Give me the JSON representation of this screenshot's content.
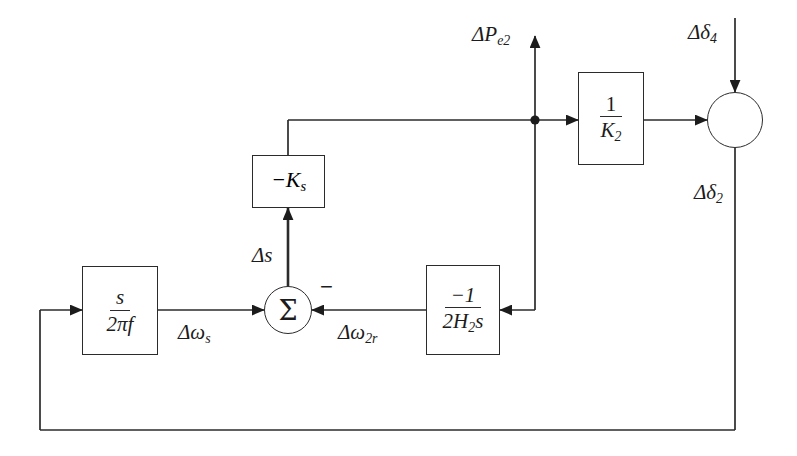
{
  "diagram": {
    "background_color": "#ffffff",
    "line_color": "#2b2b2b",
    "blocks": [
      {
        "id": "gain_s_2pif",
        "name": "s-over-2pif-block",
        "numerator": "s",
        "denominator": "2πf"
      },
      {
        "id": "gain_neg_ks",
        "name": "negative-ks-block",
        "label": "−K",
        "label_sub": "s"
      },
      {
        "id": "gain_neg1_2h2s",
        "name": "negative-one-over-2h2s-block",
        "numerator": "−1",
        "denominator_pre": "2H",
        "denominator_sub": "2",
        "denominator_post": "s"
      },
      {
        "id": "gain_1_k2",
        "name": "one-over-k2-block",
        "numerator": "1",
        "denominator": "K",
        "denominator_sub": "2"
      }
    ],
    "junctions": [
      {
        "id": "sum_left",
        "name": "summing-junction-sigma",
        "symbol": "Σ",
        "negative_input_marker": "−"
      },
      {
        "id": "sum_right",
        "name": "summing-junction-circle",
        "symbol": ""
      }
    ],
    "signals": [
      {
        "id": "d_pe2",
        "name": "delta-pe2-label",
        "base": "ΔP",
        "sub": "e2"
      },
      {
        "id": "d_delta4",
        "name": "delta-delta4-label",
        "base": "Δδ",
        "sub": "4"
      },
      {
        "id": "d_delta2",
        "name": "delta-delta2-label",
        "base": "Δδ",
        "sub": "2"
      },
      {
        "id": "d_s",
        "name": "delta-s-label",
        "base": "Δs",
        "sub": ""
      },
      {
        "id": "d_omegas",
        "name": "delta-omega-s-label",
        "base": "Δω",
        "sub": "s"
      },
      {
        "id": "d_omega2r",
        "name": "delta-omega-2r-label",
        "base": "Δω",
        "sub": "2r"
      }
    ]
  }
}
